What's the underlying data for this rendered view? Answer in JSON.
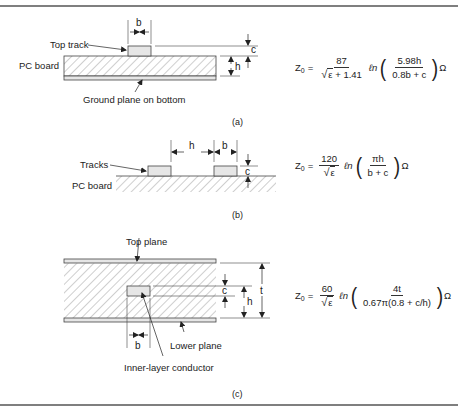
{
  "figure": {
    "panels": [
      {
        "id": "a",
        "caption": "(a)",
        "labels": {
          "top_track": "Top track",
          "pc_board": "PC board",
          "ground_plane": "Ground plane on bottom"
        },
        "dimensions": {
          "width": "b",
          "thickness": "c",
          "height": "h"
        },
        "formula": {
          "lhs": "Z",
          "lhs_sub": "0",
          "eq": "=",
          "coef_num": "87",
          "coef_den_radicand": "ε",
          "coef_den_rest": " + 1.41",
          "ln": "ℓn",
          "arg_num": "5.98h",
          "arg_den": "0.8b + c",
          "unit": "Ω"
        }
      },
      {
        "id": "b",
        "caption": "(b)",
        "labels": {
          "tracks": "Tracks",
          "pc_board": "PC board"
        },
        "dimensions": {
          "spacing": "h",
          "width": "b",
          "thickness": "c"
        },
        "formula": {
          "lhs": "Z",
          "lhs_sub": "0",
          "eq": "=",
          "coef_num": "120",
          "coef_den_radicand": "ε",
          "coef_den_rest": "",
          "ln": "ℓn",
          "arg_num": "πh",
          "arg_den": "b + c",
          "unit": "Ω"
        }
      },
      {
        "id": "c",
        "caption": "(c)",
        "labels": {
          "top_plane": "Top plane",
          "lower_plane": "Lower plane",
          "inner_conductor": "Inner-layer conductor"
        },
        "dimensions": {
          "width": "b",
          "thickness": "c",
          "height": "h",
          "total": "t"
        },
        "formula": {
          "lhs": "Z",
          "lhs_sub": "0",
          "eq": "=",
          "coef_num": "60",
          "coef_den_radicand": "ε",
          "coef_den_rest": "",
          "ln": "ℓn",
          "arg_num": "4t",
          "arg_den": "0.67π(0.8 + c/h)",
          "unit": "Ω"
        }
      }
    ],
    "colors": {
      "line": "#333333",
      "track_fill": "#e6e6e6",
      "hatch": "#777777",
      "rule": "#555555"
    }
  }
}
